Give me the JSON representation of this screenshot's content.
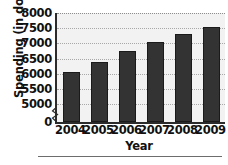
{
  "chart_data": {
    "type": "bar",
    "title": "",
    "xlabel": "Year",
    "ylabel": "Spending (in dollars)",
    "categories": [
      "2004",
      "2005",
      "2006",
      "2007",
      "2008",
      "2009"
    ],
    "values": [
      6050,
      6400,
      6750,
      7050,
      7300,
      7550
    ],
    "ylim": [
      5000,
      8000
    ],
    "y_axis_break": true,
    "y_tick_labels": [
      "8000",
      "7500",
      "7000",
      "6500",
      "6000",
      "5500",
      "5000",
      "0"
    ],
    "y_tick_values": [
      8000,
      7500,
      7000,
      6500,
      6000,
      5500,
      5000,
      0
    ],
    "grid": true,
    "grid_axis": "y",
    "legend": "none",
    "bar_color": "#333333",
    "plot_background": "#f2f2f2"
  },
  "axis": {
    "break_icon": "axis-break-zigzag"
  }
}
